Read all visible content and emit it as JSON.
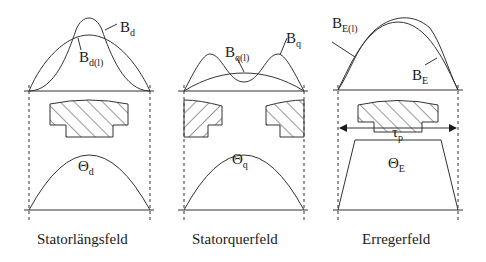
{
  "panels": [
    {
      "caption": "Statorlängsfeld",
      "curve_labels": {
        "main": "B",
        "main_sub": "d",
        "fund": "B",
        "fund_sub": "d(l)"
      },
      "mmf_label": "Θ",
      "mmf_sub": "d"
    },
    {
      "caption": "Statorquerfeld",
      "curve_labels": {
        "main": "B",
        "main_sub": "q",
        "fund": "B",
        "fund_sub": "q(l)"
      },
      "mmf_label": "Θ",
      "mmf_sub": "q"
    },
    {
      "caption": "Erregerfeld",
      "curve_labels": {
        "main": "B",
        "main_sub": "E",
        "fund": "B",
        "fund_sub": "E(l)"
      },
      "mmf_label": "Θ",
      "mmf_sub": "E",
      "pitch_label": "τ",
      "pitch_sub": "p"
    }
  ]
}
